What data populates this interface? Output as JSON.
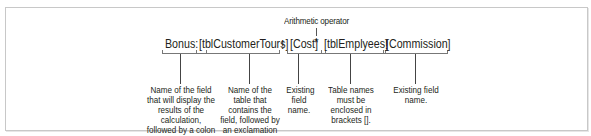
{
  "diagram": {
    "operator_label": "Arithmetic operator",
    "formula": {
      "tokens": [
        {
          "text": "Bonus:",
          "role": "calculated field name"
        },
        {
          "text": "[tblCustomerTours]",
          "role": "table name"
        },
        {
          "text": "!",
          "role": "separator"
        },
        {
          "text": "[Cost]",
          "role": "field name"
        },
        {
          "text": "*",
          "role": "arithmetic operator"
        },
        {
          "text": "[tblEmplyees]",
          "role": "table name"
        },
        {
          "text": "!",
          "role": "separator"
        },
        {
          "text": "[Commission]",
          "role": "field name"
        }
      ]
    },
    "annotations": [
      {
        "target": "Bonus:",
        "text": "Name of the field that will display the results of the calculation, followed by a colon (:)."
      },
      {
        "target": "[tblCustomerTours]",
        "text": "Name of the table that contains the field, followed by an exclamation mark(!)."
      },
      {
        "target": "[Cost]",
        "text": "Existing field name."
      },
      {
        "target": "[tblEmplyees]",
        "text": "Table names must be enclosed in brackets []."
      },
      {
        "target": "[Commission]",
        "text": "Existing field name."
      }
    ]
  }
}
